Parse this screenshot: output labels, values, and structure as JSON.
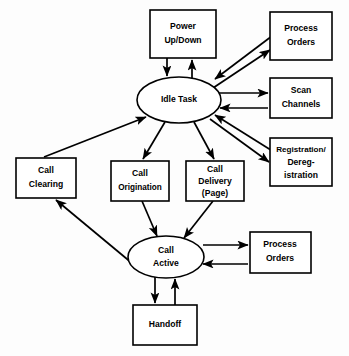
{
  "diagram": {
    "background_color": "#fdfdfd",
    "line_color": "#000000",
    "node_fill": "#ffffff",
    "states": [
      {
        "id": "power_up_down",
        "shape": "rectangle",
        "lines": [
          "Power",
          "Up/Down"
        ],
        "x": 150,
        "y": 10,
        "w": 66,
        "h": 48
      },
      {
        "id": "process_orders_idle",
        "shape": "rectangle",
        "lines": [
          "Process",
          "Orders"
        ],
        "x": 270,
        "y": 12,
        "w": 62,
        "h": 48
      },
      {
        "id": "scan_channels",
        "shape": "rectangle",
        "lines": [
          "Scan",
          "Channels"
        ],
        "x": 270,
        "y": 78,
        "w": 62,
        "h": 40
      },
      {
        "id": "registration",
        "shape": "rectangle",
        "lines": [
          "Registration/",
          "Dereg-",
          "istration"
        ],
        "x": 270,
        "y": 138,
        "w": 62,
        "h": 48
      },
      {
        "id": "idle_task",
        "shape": "ellipse",
        "lines": [
          "Idle Task"
        ],
        "cx": 179,
        "cy": 100,
        "rx": 42,
        "ry": 23
      },
      {
        "id": "call_clearing",
        "shape": "rectangle",
        "lines": [
          "Call",
          "Clearing"
        ],
        "x": 16,
        "y": 158,
        "w": 60,
        "h": 40
      },
      {
        "id": "call_origination",
        "shape": "rectangle",
        "lines": [
          "Call",
          "Origination"
        ],
        "x": 111,
        "y": 161,
        "w": 58,
        "h": 40
      },
      {
        "id": "call_delivery",
        "shape": "rectangle",
        "lines": [
          "Call",
          "Delivery",
          "(Page)"
        ],
        "x": 186,
        "y": 161,
        "w": 58,
        "h": 40
      },
      {
        "id": "call_active",
        "shape": "ellipse",
        "lines": [
          "Call",
          "Active"
        ],
        "cx": 166,
        "cy": 257,
        "rx": 38,
        "ry": 21
      },
      {
        "id": "process_orders_active",
        "shape": "rectangle",
        "lines": [
          "Process",
          "Orders"
        ],
        "x": 250,
        "y": 232,
        "w": 61,
        "h": 41
      },
      {
        "id": "handoff",
        "shape": "rectangle",
        "lines": [
          "Handoff"
        ],
        "x": 133,
        "y": 305,
        "w": 64,
        "h": 40
      }
    ],
    "transitions": [
      {
        "from": "power_up_down",
        "to": "idle_task",
        "label": "",
        "direction": "down"
      },
      {
        "from": "idle_task",
        "to": "power_up_down",
        "label": "",
        "direction": "up"
      },
      {
        "from": "process_orders_idle",
        "to": "idle_task",
        "label": "",
        "direction": "diagonal-down-left"
      },
      {
        "from": "idle_task",
        "to": "process_orders_idle",
        "label": "",
        "direction": "diagonal-up-right"
      },
      {
        "from": "idle_task",
        "to": "scan_channels",
        "label": "",
        "direction": "right"
      },
      {
        "from": "scan_channels",
        "to": "idle_task",
        "label": "",
        "direction": "left"
      },
      {
        "from": "idle_task",
        "to": "registration",
        "label": "",
        "direction": "diagonal-down-right"
      },
      {
        "from": "registration",
        "to": "idle_task",
        "label": "",
        "direction": "diagonal-up-left"
      },
      {
        "from": "call_clearing",
        "to": "idle_task",
        "label": "",
        "direction": "diagonal-up-right"
      },
      {
        "from": "idle_task",
        "to": "call_origination",
        "label": "",
        "direction": "diagonal-down-left"
      },
      {
        "from": "idle_task",
        "to": "call_delivery",
        "label": "",
        "direction": "diagonal-down-right"
      },
      {
        "from": "call_origination",
        "to": "call_active",
        "label": "",
        "direction": "diagonal-down-right"
      },
      {
        "from": "call_delivery",
        "to": "call_active",
        "label": "",
        "direction": "diagonal-down-left"
      },
      {
        "from": "call_active",
        "to": "call_clearing",
        "label": "",
        "direction": "diagonal-up-left"
      },
      {
        "from": "call_active",
        "to": "process_orders_active",
        "label": "",
        "direction": "right"
      },
      {
        "from": "process_orders_active",
        "to": "call_active",
        "label": "",
        "direction": "left"
      },
      {
        "from": "call_active",
        "to": "handoff",
        "label": "",
        "direction": "down"
      },
      {
        "from": "handoff",
        "to": "call_active",
        "label": "",
        "direction": "up"
      }
    ]
  }
}
